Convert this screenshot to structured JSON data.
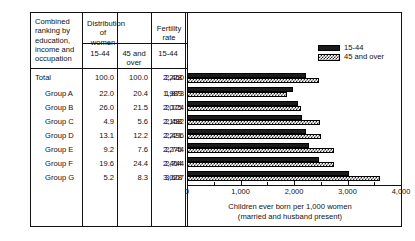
{
  "table": {
    "stub_header": "Combined ranking by education, income and occupation",
    "group_headers": [
      {
        "label": "Distribution of women"
      },
      {
        "label": "Fertility rate"
      }
    ],
    "sub_headers": [
      "15-44",
      "45 and over",
      "15-44",
      "45 and over"
    ],
    "rows": [
      {
        "label": "Total",
        "indent": false,
        "dist_15_44": "100.0",
        "dist_45_over": "100.0",
        "fert_15_44": "2,228",
        "fert_45_over": "2,460"
      },
      {
        "label": "Group A",
        "indent": true,
        "dist_15_44": "22.0",
        "dist_45_over": "20.4",
        "fert_15_44": "1,989",
        "fert_45_over": "1,873"
      },
      {
        "label": "Group B",
        "indent": true,
        "dist_15_44": "26.0",
        "dist_45_over": "21.5",
        "fert_15_44": "2,075",
        "fert_45_over": "2,124"
      },
      {
        "label": "Group C",
        "indent": true,
        "dist_15_44": "4.9",
        "dist_45_over": "5.6",
        "fert_15_44": "2,158",
        "fert_45_over": "2,482"
      },
      {
        "label": "Group D",
        "indent": true,
        "dist_15_44": "13.1",
        "dist_45_over": "12.2",
        "fert_15_44": "2,221",
        "fert_45_over": "2,496"
      },
      {
        "label": "Group E",
        "indent": true,
        "dist_15_44": "9.2",
        "dist_45_over": "7.6",
        "fert_15_44": "2,275",
        "fert_45_over": "2,744"
      },
      {
        "label": "Group F",
        "indent": true,
        "dist_15_44": "19.6",
        "dist_45_over": "24.4",
        "fert_15_44": "2,464",
        "fert_45_over": "2,744"
      },
      {
        "label": "Group G",
        "indent": true,
        "dist_15_44": "5.2",
        "dist_45_over": "8.3",
        "fert_15_44": "3,028",
        "fert_45_over": "3,607"
      }
    ]
  },
  "legend": {
    "items": [
      {
        "label": "15-44",
        "pattern": "solid"
      },
      {
        "label": "45 and over",
        "pattern": "hatch"
      }
    ]
  },
  "chart_data": {
    "type": "bar",
    "orientation": "horizontal",
    "title": "",
    "xlabel_line1": "Children ever born per 1,000 women",
    "xlabel_line2": "(married and husband present)",
    "ylabel": "",
    "categories": [
      "Total",
      "Group A",
      "Group B",
      "Group C",
      "Group D",
      "Group E",
      "Group F",
      "Group G"
    ],
    "series": [
      {
        "name": "15-44",
        "pattern": "solid",
        "values": [
          2228,
          1989,
          2075,
          2158,
          2221,
          2275,
          2464,
          3028
        ]
      },
      {
        "name": "45 and over",
        "pattern": "hatch",
        "values": [
          2460,
          1873,
          2124,
          2482,
          2496,
          2744,
          2744,
          3607
        ]
      }
    ],
    "xlim": [
      0,
      4000
    ],
    "xticks": [
      0,
      1000,
      2000,
      3000,
      4000
    ],
    "xtick_labels": [
      "0",
      "1,000",
      "2,000",
      "3,000",
      "4,000"
    ],
    "xminor_ticks": [
      500,
      1500,
      2500,
      3500
    ],
    "grid": false,
    "legend_position": "top-right"
  }
}
